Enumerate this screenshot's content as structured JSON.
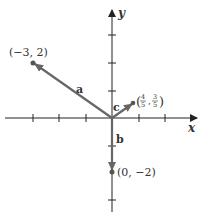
{
  "diagram": {
    "type": "vector-plot",
    "axes": {
      "x_label": "x",
      "y_label": "y",
      "origin_px": [
        112,
        118
      ],
      "unit_px": 26.5,
      "x_ticks": [
        -3,
        -2,
        -1,
        1,
        2
      ],
      "y_ticks": [
        -3,
        -1,
        1,
        2,
        3
      ]
    },
    "vectors": [
      {
        "name": "a",
        "label": "a",
        "end": [
          -3,
          2
        ],
        "end_label": "(−3, 2)"
      },
      {
        "name": "b",
        "label": "b",
        "end": [
          0,
          -2
        ],
        "end_label": "(0, −2)"
      },
      {
        "name": "c",
        "label": "c",
        "end": [
          0.8,
          0.6
        ],
        "end_label_num": [
          "4",
          "3"
        ],
        "end_label_den": [
          "5",
          "5"
        ]
      }
    ],
    "colors": {
      "axis": "#222222",
      "vector": "#666666",
      "text": "#333333"
    }
  }
}
